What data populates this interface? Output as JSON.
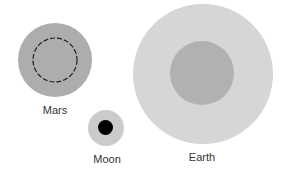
{
  "diagram": {
    "type": "size-comparison",
    "bodies": [
      {
        "name": "Mars",
        "label": "Mars",
        "outer": {
          "cx": 55,
          "cy": 60,
          "r": 37,
          "color": "#adadad"
        },
        "inner": {
          "cx": 55,
          "cy": 60,
          "r": 22,
          "style": "dashed",
          "stroke": "#222222"
        },
        "label_pos": {
          "x": 55,
          "y": 114
        }
      },
      {
        "name": "Moon",
        "label": "Moon",
        "outer": {
          "cx": 106,
          "cy": 128,
          "r": 18,
          "color": "#cbcbcb"
        },
        "inner": {
          "cx": 105.5,
          "cy": 127.5,
          "r": 7.5,
          "color": "#000000"
        },
        "label_pos": {
          "x": 107,
          "y": 163
        }
      },
      {
        "name": "Earth",
        "label": "Earth",
        "outer": {
          "cx": 203,
          "cy": 74,
          "r": 70,
          "color": "#d6d6d6"
        },
        "inner": {
          "cx": 202,
          "cy": 73,
          "r": 32,
          "color": "#b1b1b1"
        },
        "label_pos": {
          "x": 202,
          "y": 161
        }
      }
    ]
  }
}
